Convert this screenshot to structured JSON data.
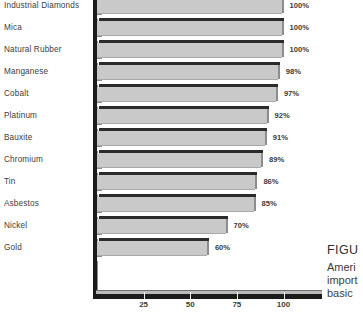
{
  "chart_data": {
    "type": "bar",
    "orientation": "horizontal",
    "title": "",
    "xlabel": "",
    "ylabel": "",
    "xlim": [
      0,
      110
    ],
    "grid": false,
    "legend": null,
    "categories": [
      "Industrial Diamonds",
      "Mica",
      "Natural Rubber",
      "Manganese",
      "Cobalt",
      "Platinum",
      "Bauxite",
      "Chromium",
      "Tin",
      "Asbestos",
      "Nickel",
      "Gold"
    ],
    "values": [
      100,
      100,
      100,
      98,
      97,
      92,
      91,
      89,
      86,
      85,
      70,
      60
    ],
    "value_labels": [
      "100%",
      "100%",
      "100%",
      "98%",
      "97%",
      "92%",
      "91%",
      "89%",
      "86%",
      "85%",
      "70%",
      "60%"
    ],
    "xticks": [
      25,
      50,
      75,
      100
    ],
    "xtick_labels": [
      "25",
      "50",
      "75",
      "100"
    ],
    "bar_color": "#c9c9c9",
    "bar_edge_color": "#2b2b2b",
    "axis_color": "#1b1b1b",
    "text_color": "#3c3c3c"
  },
  "caption": {
    "figure_label": "FIGU",
    "lines": [
      "Ameri",
      "import",
      "basic"
    ]
  }
}
